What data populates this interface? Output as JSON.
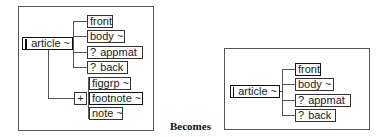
{
  "before": {
    "root": {
      "label": "article",
      "suffix": "~"
    },
    "children": [
      {
        "label": "front",
        "suffix": "",
        "optional": false
      },
      {
        "label": "body",
        "suffix": "~",
        "optional": false
      },
      {
        "label": "appmat",
        "suffix": "",
        "optional": true
      },
      {
        "label": "back",
        "suffix": "",
        "optional": true
      }
    ],
    "group": {
      "expander": "+",
      "items": [
        {
          "label": "figgrp",
          "suffix": "~"
        },
        {
          "label": "footnote",
          "suffix": "~"
        },
        {
          "label": "note",
          "suffix": "~"
        }
      ]
    }
  },
  "caption": "Becomes",
  "after": {
    "root": {
      "label": "article",
      "suffix": "~"
    },
    "children": [
      {
        "label": "front",
        "suffix": "",
        "optional": false
      },
      {
        "label": "body",
        "suffix": "~",
        "optional": false
      },
      {
        "label": "appmat",
        "suffix": "",
        "optional": true
      },
      {
        "label": "back",
        "suffix": "",
        "optional": true
      }
    ]
  },
  "optional_marker": "?"
}
